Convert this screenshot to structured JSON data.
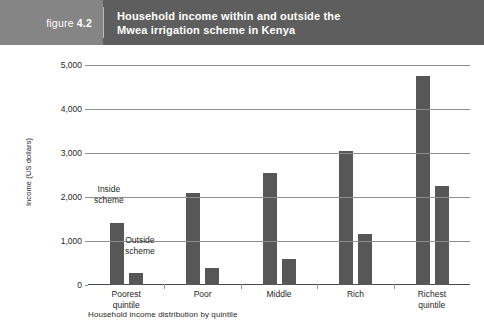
{
  "banner": {
    "figure_word": "figure",
    "figure_number": "4.2",
    "title_line1": "Household income within and outside the",
    "title_line2": "Mwea irrigation scheme in Kenya",
    "band_color": "#5e5e5e",
    "tag_color": "#858585",
    "text_color": "#ffffff"
  },
  "chart_data": {
    "type": "bar",
    "title": "Household income within and outside the Mwea irrigation scheme in Kenya",
    "subtitle": "",
    "xlabel": "Household income distribution by quintile",
    "ylabel": "Income (US dollars)",
    "categories": [
      "Poorest quintile",
      "Poor",
      "Middle",
      "Rich",
      "Richest quintile"
    ],
    "category_lines": [
      [
        "Poorest",
        "quintile"
      ],
      [
        "Poor"
      ],
      [
        "Middle"
      ],
      [
        "Rich"
      ],
      [
        "Richest",
        "quintile"
      ]
    ],
    "series": [
      {
        "name": "Inside scheme",
        "values": [
          1400,
          2080,
          2550,
          3050,
          4750
        ]
      },
      {
        "name": "Outside scheme",
        "values": [
          280,
          380,
          600,
          1150,
          2250
        ]
      }
    ],
    "ylim": [
      0,
      5000
    ],
    "yticks": [
      0,
      1000,
      2000,
      3000,
      4000,
      5000
    ],
    "ytick_labels": [
      "0",
      "1,000",
      "2,000",
      "3,000",
      "4,000",
      "5,000"
    ],
    "grid": "horizontal",
    "legend": "none",
    "annotations": [
      {
        "text_lines": [
          "Inside",
          "scheme"
        ],
        "target_series": "Inside scheme",
        "target_category": "Poorest quintile"
      },
      {
        "text_lines": [
          "Outside",
          "scheme"
        ],
        "target_series": "Outside scheme",
        "target_category": "Poorest quintile"
      }
    ],
    "bar_color": "#575757",
    "grid_color": "#8e8e8e"
  }
}
